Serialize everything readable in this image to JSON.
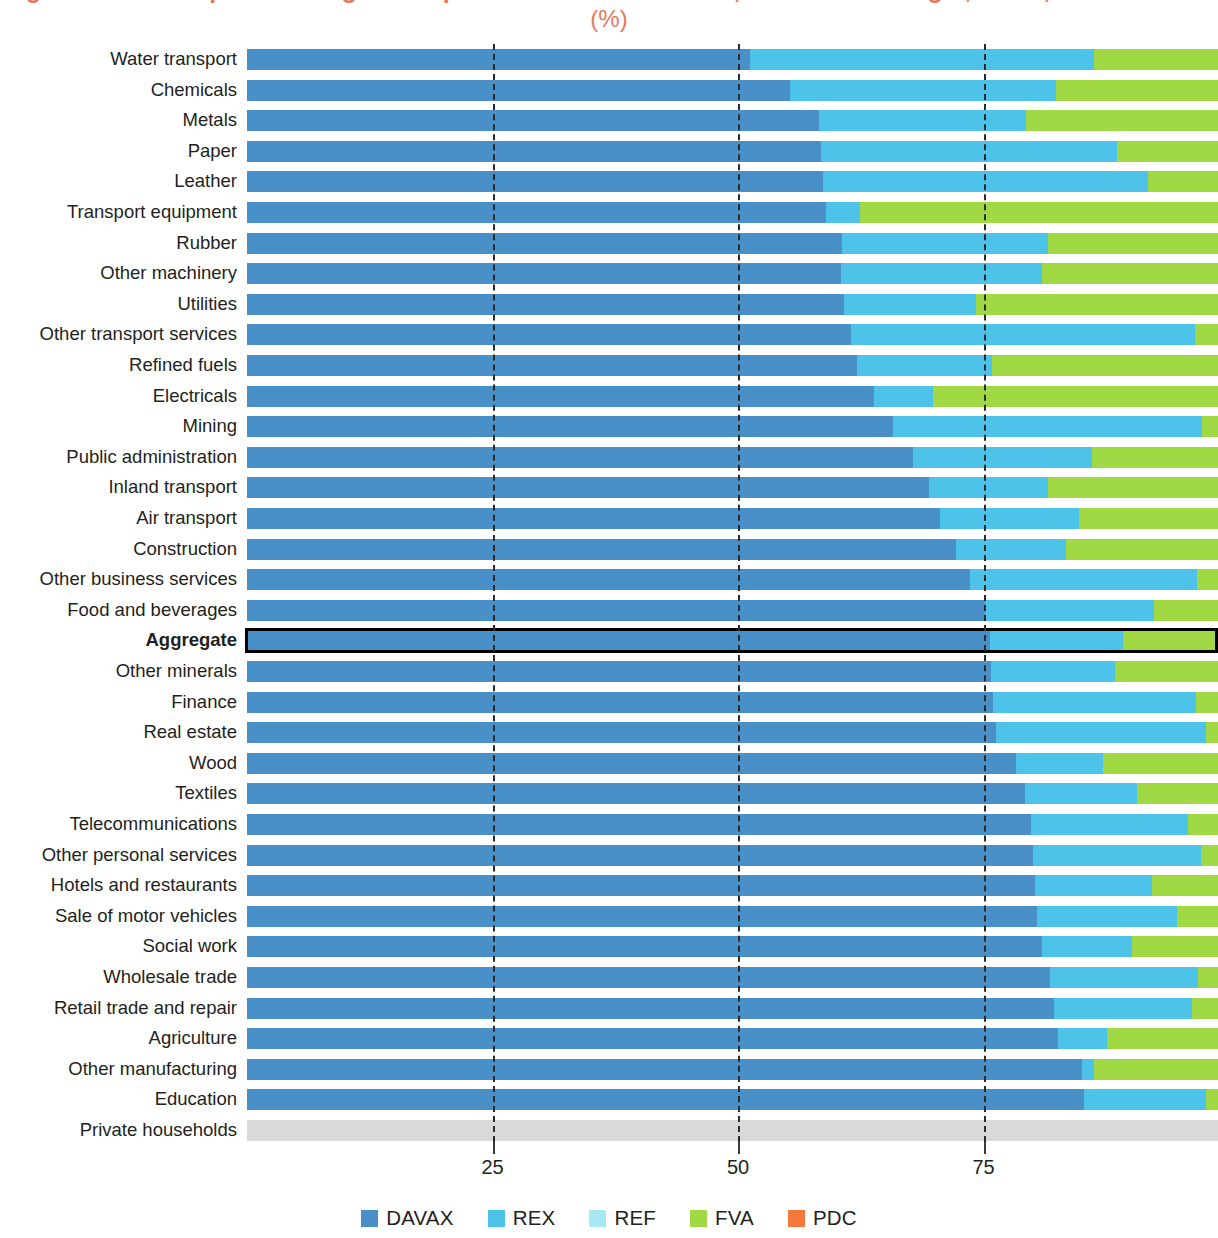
{
  "figure": {
    "title": "Figure 1.5  Decomposition of gross exports of selected sectors, value added origin, world, 2011",
    "subtitle": "(%)",
    "title_color": "#e8785a"
  },
  "axis": {
    "ticks": [
      {
        "value": 25,
        "label": "25"
      },
      {
        "value": 50,
        "label": "50"
      },
      {
        "value": 75,
        "label": "75"
      }
    ],
    "min": 0,
    "max": 98.7,
    "grid": "dashed"
  },
  "legend": {
    "position": "bottom-center",
    "entries": [
      {
        "name": "DAVAX",
        "color": "#4a90c8"
      },
      {
        "name": "REX",
        "color": "#4ec3ea"
      },
      {
        "name": "REF",
        "color": "#a7e8f5"
      },
      {
        "name": "FVA",
        "color": "#a0d943"
      },
      {
        "name": "PDC",
        "color": "#f5783c"
      }
    ]
  },
  "colors": {
    "DAVAX": "#4a90c8",
    "REX": "#4ec3ea",
    "REF": "#a7e8f5",
    "FVA": "#a0d943",
    "PDC": "#f5783c",
    "NODATA": "#d9d9d9"
  },
  "chart_data": {
    "type": "bar",
    "orientation": "horizontal",
    "stacked": true,
    "title": "Figure 1.5  Decomposition of gross exports of selected sectors, value added origin, world, 2011",
    "subtitle": "(%)",
    "xlabel": "",
    "ylabel": "",
    "xlim": [
      0,
      98.7
    ],
    "xticks": [
      25,
      50,
      75
    ],
    "grid": true,
    "legend_position": "bottom",
    "series": [
      {
        "name": "DAVAX",
        "color": "#4a90c8"
      },
      {
        "name": "REX",
        "color": "#4ec3ea"
      },
      {
        "name": "REF",
        "color": "#a7e8f5"
      },
      {
        "name": "FVA",
        "color": "#a0d943"
      },
      {
        "name": "PDC",
        "color": "#f5783c"
      }
    ],
    "categories": [
      "Water transport",
      "Chemicals",
      "Metals",
      "Paper",
      "Leather",
      "Transport equipment",
      "Rubber",
      "Other machinery",
      "Utilities",
      "Other transport services",
      "Refined fuels",
      "Electricals",
      "Mining",
      "Public administration",
      "Inland transport",
      "Air transport",
      "Construction",
      "Other business services",
      "Food and beverages",
      "Aggregate",
      "Other minerals",
      "Finance",
      "Real estate",
      "Wood",
      "Textiles",
      "Telecommunications",
      "Other personal services",
      "Hotels and restaurants",
      "Sale of motor vehicles",
      "Social work",
      "Wholesale trade",
      "Retail trade and repair",
      "Agriculture",
      "Other manufacturing",
      "Education",
      "Private households"
    ],
    "rows": [
      {
        "category": "Water transport",
        "highlight": false,
        "no_data": false,
        "DAVAX": 51.2,
        "REX": 35.1,
        "REF": 0.0,
        "FVA": 12.4,
        "PDC": 0.0
      },
      {
        "category": "Chemicals",
        "highlight": false,
        "no_data": false,
        "DAVAX": 55.3,
        "REX": 27.1,
        "REF": 0.0,
        "FVA": 16.3,
        "PDC": 0.0
      },
      {
        "category": "Metals",
        "highlight": false,
        "no_data": false,
        "DAVAX": 58.2,
        "REX": 21.1,
        "REF": 0.0,
        "FVA": 19.4,
        "PDC": 0.0
      },
      {
        "category": "Paper",
        "highlight": false,
        "no_data": false,
        "DAVAX": 58.5,
        "REX": 30.1,
        "REF": 0.0,
        "FVA": 10.1,
        "PDC": 0.0
      },
      {
        "category": "Leather",
        "highlight": false,
        "no_data": false,
        "DAVAX": 58.7,
        "REX": 33.1,
        "REF": 0.0,
        "FVA": 6.9,
        "PDC": 0.0
      },
      {
        "category": "Transport equipment",
        "highlight": false,
        "no_data": false,
        "DAVAX": 59.0,
        "REX": 3.4,
        "REF": 0.0,
        "FVA": 36.3,
        "PDC": 0.0
      },
      {
        "category": "Rubber",
        "highlight": false,
        "no_data": false,
        "DAVAX": 60.6,
        "REX": 21.0,
        "REF": 0.0,
        "FVA": 17.1,
        "PDC": 0.0
      },
      {
        "category": "Other machinery",
        "highlight": false,
        "no_data": false,
        "DAVAX": 60.5,
        "REX": 20.5,
        "REF": 0.0,
        "FVA": 17.7,
        "PDC": 0.0
      },
      {
        "category": "Utilities",
        "highlight": false,
        "no_data": false,
        "DAVAX": 60.8,
        "REX": 13.4,
        "REF": 0.0,
        "FVA": 24.5,
        "PDC": 0.0
      },
      {
        "category": "Other transport services",
        "highlight": false,
        "no_data": false,
        "DAVAX": 61.5,
        "REX": 35.0,
        "REF": 0.0,
        "FVA": 2.2,
        "PDC": 0.0
      },
      {
        "category": "Refined fuels",
        "highlight": false,
        "no_data": false,
        "DAVAX": 62.1,
        "REX": 13.8,
        "REF": 0.0,
        "FVA": 22.8,
        "PDC": 0.0
      },
      {
        "category": "Electricals",
        "highlight": false,
        "no_data": false,
        "DAVAX": 63.8,
        "REX": 6.1,
        "REF": 0.0,
        "FVA": 28.8,
        "PDC": 0.0
      },
      {
        "category": "Mining",
        "highlight": false,
        "no_data": false,
        "DAVAX": 65.8,
        "REX": 31.5,
        "REF": 0.0,
        "FVA": 1.4,
        "PDC": 0.0
      },
      {
        "category": "Public administration",
        "highlight": false,
        "no_data": false,
        "DAVAX": 67.8,
        "REX": 18.2,
        "REF": 0.0,
        "FVA": 12.7,
        "PDC": 0.0
      },
      {
        "category": "Inland transport",
        "highlight": false,
        "no_data": false,
        "DAVAX": 69.4,
        "REX": 12.2,
        "REF": 0.0,
        "FVA": 17.1,
        "PDC": 0.0
      },
      {
        "category": "Air transport",
        "highlight": false,
        "no_data": false,
        "DAVAX": 70.6,
        "REX": 14.1,
        "REF": 0.0,
        "FVA": 14.0,
        "PDC": 0.0
      },
      {
        "category": "Construction",
        "highlight": false,
        "no_data": false,
        "DAVAX": 72.2,
        "REX": 11.2,
        "REF": 0.0,
        "FVA": 15.3,
        "PDC": 0.0
      },
      {
        "category": "Other business services",
        "highlight": false,
        "no_data": false,
        "DAVAX": 73.6,
        "REX": 23.1,
        "REF": 0.0,
        "FVA": 2.0,
        "PDC": 0.0
      },
      {
        "category": "Food and beverages",
        "highlight": false,
        "no_data": false,
        "DAVAX": 75.2,
        "REX": 17.2,
        "REF": 0.0,
        "FVA": 6.3,
        "PDC": 0.0
      },
      {
        "category": "Aggregate",
        "highlight": true,
        "no_data": false,
        "DAVAX": 75.7,
        "REX": 13.5,
        "REF": 0.0,
        "FVA": 9.5,
        "PDC": 0.0
      },
      {
        "category": "Other minerals",
        "highlight": false,
        "no_data": false,
        "DAVAX": 75.8,
        "REX": 12.6,
        "REF": 0.0,
        "FVA": 10.3,
        "PDC": 0.0
      },
      {
        "category": "Finance",
        "highlight": false,
        "no_data": false,
        "DAVAX": 76.0,
        "REX": 20.6,
        "REF": 0.0,
        "FVA": 2.1,
        "PDC": 0.0
      },
      {
        "category": "Real estate",
        "highlight": false,
        "no_data": false,
        "DAVAX": 76.3,
        "REX": 21.4,
        "REF": 0.0,
        "FVA": 1.0,
        "PDC": 0.0
      },
      {
        "category": "Wood",
        "highlight": false,
        "no_data": false,
        "DAVAX": 78.3,
        "REX": 8.9,
        "REF": 0.0,
        "FVA": 11.5,
        "PDC": 0.0
      },
      {
        "category": "Textiles",
        "highlight": false,
        "no_data": false,
        "DAVAX": 79.2,
        "REX": 11.4,
        "REF": 0.0,
        "FVA": 8.1,
        "PDC": 0.0
      },
      {
        "category": "Telecommunications",
        "highlight": false,
        "no_data": false,
        "DAVAX": 79.8,
        "REX": 16.0,
        "REF": 0.0,
        "FVA": 2.9,
        "PDC": 0.0
      },
      {
        "category": "Other personal services",
        "highlight": false,
        "no_data": false,
        "DAVAX": 80.0,
        "REX": 17.2,
        "REF": 0.0,
        "FVA": 1.5,
        "PDC": 0.0
      },
      {
        "category": "Hotels and restaurants",
        "highlight": false,
        "no_data": false,
        "DAVAX": 80.2,
        "REX": 12.0,
        "REF": 0.0,
        "FVA": 6.5,
        "PDC": 0.0
      },
      {
        "category": "Sale of motor vehicles",
        "highlight": false,
        "no_data": false,
        "DAVAX": 80.4,
        "REX": 14.3,
        "REF": 0.0,
        "FVA": 4.0,
        "PDC": 0.0
      },
      {
        "category": "Social work",
        "highlight": false,
        "no_data": false,
        "DAVAX": 81.0,
        "REX": 9.1,
        "REF": 0.0,
        "FVA": 8.6,
        "PDC": 0.0
      },
      {
        "category": "Wholesale trade",
        "highlight": false,
        "no_data": false,
        "DAVAX": 81.8,
        "REX": 15.0,
        "REF": 0.0,
        "FVA": 1.9,
        "PDC": 0.0
      },
      {
        "category": "Retail trade and repair",
        "highlight": false,
        "no_data": false,
        "DAVAX": 82.2,
        "REX": 14.0,
        "REF": 0.0,
        "FVA": 2.5,
        "PDC": 0.0
      },
      {
        "category": "Agriculture",
        "highlight": false,
        "no_data": false,
        "DAVAX": 82.6,
        "REX": 5.0,
        "REF": 0.0,
        "FVA": 11.1,
        "PDC": 0.0
      },
      {
        "category": "Other manufacturing",
        "highlight": false,
        "no_data": false,
        "DAVAX": 85.0,
        "REX": 1.3,
        "REF": 0.0,
        "FVA": 12.4,
        "PDC": 0.0
      },
      {
        "category": "Education",
        "highlight": false,
        "no_data": false,
        "DAVAX": 85.2,
        "REX": 12.5,
        "REF": 0.0,
        "FVA": 1.0,
        "PDC": 0.0
      },
      {
        "category": "Private households",
        "highlight": false,
        "no_data": true,
        "DAVAX": 0.0,
        "REX": 0.0,
        "REF": 0.0,
        "FVA": 0.0,
        "PDC": 0.0
      }
    ]
  }
}
